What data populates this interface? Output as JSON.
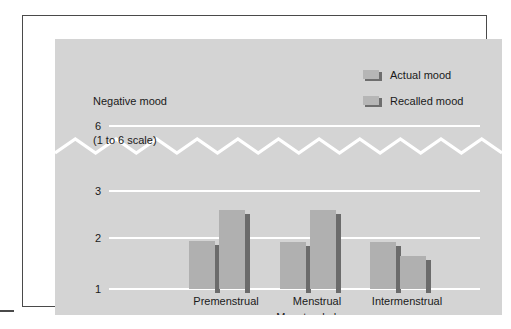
{
  "chart_data": {
    "type": "bar",
    "title": "",
    "ylabel_line1": "Negative mood",
    "ylabel_line2": "(1 to 6 scale)",
    "xlabel": "Menstrual phase",
    "categories": [
      "Premenstrual",
      "Menstrual",
      "Intermenstrual"
    ],
    "series": [
      {
        "name": "Actual mood",
        "values": [
          1.95,
          1.92,
          1.93
        ]
      },
      {
        "name": "Recalled mood",
        "values": [
          2.55,
          2.55,
          1.65
        ]
      }
    ],
    "ytick_labels": [
      "6",
      "3",
      "2",
      "1"
    ],
    "ytick_values": [
      6,
      3,
      2,
      1
    ],
    "ylim": [
      1,
      6
    ],
    "axis_break": true,
    "axis_break_between": [
      3,
      6
    ],
    "grid": true,
    "legend_position": "top-right",
    "colors": {
      "plot_background": "#d4d4d4",
      "gridline": "#ffffff",
      "bar_face": "#b0b0b0",
      "bar_shadow": "#6b6b6b",
      "text": "#1a1a1a",
      "frame_border": "#4a4a4a",
      "page_background": "#ffffff"
    }
  },
  "legend": {
    "items": [
      {
        "label": "Actual mood"
      },
      {
        "label": "Recalled mood"
      }
    ]
  },
  "y_axis": {
    "caption_line1": "Negative mood",
    "caption_line2": "(1 to 6 scale)",
    "ticks": [
      {
        "label": "6"
      },
      {
        "label": "3"
      },
      {
        "label": "2"
      },
      {
        "label": "1"
      }
    ]
  },
  "x_axis": {
    "title": "Menstrual phase",
    "categories": [
      {
        "label": "Premenstrual"
      },
      {
        "label": "Menstrual"
      },
      {
        "label": "Intermenstrual"
      }
    ]
  }
}
